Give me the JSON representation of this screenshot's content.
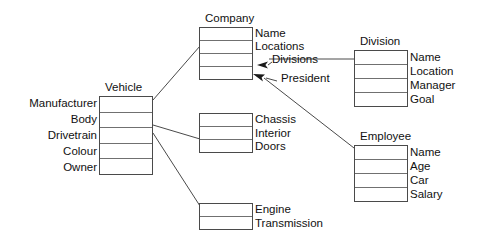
{
  "diagram": {
    "type": "entity-relationship-diagram",
    "background_color": "#ffffff",
    "line_color": "#4a4a4a",
    "text_color": "#111111",
    "entities": [
      {
        "id": "vehicle",
        "title": "Vehicle",
        "title_position": "top",
        "label_side": "left",
        "rows": 5,
        "box": {
          "x": 99,
          "y": 96,
          "w": 54,
          "h": 79
        },
        "attributes": [
          "Manufacturer",
          "Body",
          "Drivetrain",
          "Colour",
          "Owner"
        ]
      },
      {
        "id": "company",
        "title": "Company",
        "title_position": "top",
        "label_side": "right",
        "rows": 4,
        "box": {
          "x": 199,
          "y": 27,
          "w": 54,
          "h": 53
        },
        "attributes": [
          "Name",
          "Locations",
          "",
          ""
        ]
      },
      {
        "id": "division",
        "title": "Division",
        "title_position": "top",
        "label_side": "right",
        "rows": 4,
        "box": {
          "x": 354,
          "y": 50,
          "w": 54,
          "h": 57
        },
        "attributes": [
          "Name",
          "Location",
          "Manager",
          "Goal"
        ]
      },
      {
        "id": "employee",
        "title": "Employee",
        "title_position": "top",
        "label_side": "right",
        "rows": 4,
        "box": {
          "x": 354,
          "y": 145,
          "w": 54,
          "h": 57
        },
        "attributes": [
          "Name",
          "Age",
          "Car",
          "Salary"
        ]
      },
      {
        "id": "body-detail",
        "title": "",
        "title_position": "none",
        "label_side": "right",
        "rows": 3,
        "box": {
          "x": 199,
          "y": 113,
          "w": 54,
          "h": 40
        },
        "attributes": [
          "Chassis",
          "Interior",
          "Doors"
        ]
      },
      {
        "id": "drivetrain-detail",
        "title": "",
        "title_position": "none",
        "label_side": "right",
        "rows": 2,
        "box": {
          "x": 199,
          "y": 203,
          "w": 54,
          "h": 27
        },
        "attributes": [
          "Engine",
          "Transmission"
        ]
      }
    ],
    "edge_labels": [
      {
        "id": "divisions-label",
        "text": "Divisions",
        "x": 272,
        "y": 59
      },
      {
        "id": "president-label",
        "text": "President",
        "x": 281,
        "y": 78
      }
    ],
    "connectors": [
      {
        "id": "vehicle-to-company",
        "from": "vehicle",
        "to": "company",
        "arrow": false
      },
      {
        "id": "vehicle-to-body-detail",
        "from": "vehicle",
        "to": "body-detail",
        "arrow": false
      },
      {
        "id": "vehicle-to-drivetrain-detail",
        "from": "vehicle",
        "to": "drivetrain-detail",
        "arrow": false
      },
      {
        "id": "division-to-company",
        "from": "division",
        "to": "company",
        "arrow": true,
        "label": "Divisions"
      },
      {
        "id": "employee-to-company",
        "from": "employee",
        "to": "company",
        "arrow": true,
        "label": "President"
      }
    ]
  }
}
